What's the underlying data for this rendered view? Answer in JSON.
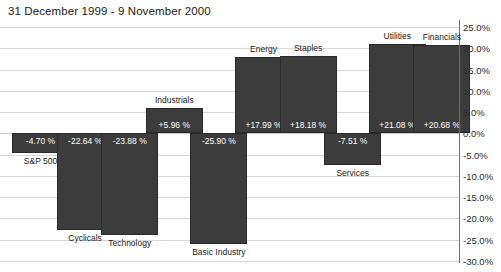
{
  "chart_data": {
    "type": "bar",
    "title": "31 December 1999 - 9 November 2000",
    "xlabel": "",
    "ylabel": "",
    "ylim": [
      -30.0,
      25.0
    ],
    "grid": true,
    "legend": "none",
    "categories": [
      "S&P 500",
      "Cyclicals",
      "Technology",
      "Industrials",
      "Basic Industry",
      "Energy",
      "Staples",
      "Services",
      "Utilities",
      "Financials"
    ],
    "values": [
      -4.7,
      -22.64,
      -23.88,
      5.96,
      -25.9,
      17.99,
      18.18,
      -7.51,
      21.08,
      20.68
    ],
    "value_labels": [
      "-4.70 %",
      "-22.64 %",
      "-23.88 %",
      "+5.96 %",
      "-25.90 %",
      "+17.99 %",
      "+18.18 %",
      "-7.51 %",
      "+21.08 %",
      "+20.68 %"
    ],
    "yticks": [
      "25.0%",
      "20.0%",
      "15.0%",
      "10.0%",
      "5.0%",
      "0.0%",
      "-5.0%",
      "-10.0%",
      "-15.0%",
      "-20.0%",
      "-25.0%",
      "-30.0%"
    ],
    "ytick_values": [
      25.0,
      20.0,
      15.0,
      10.0,
      5.0,
      0.0,
      -5.0,
      -10.0,
      -15.0,
      -20.0,
      -25.0,
      -30.0
    ],
    "colors": {
      "bar": "#3c3c3c",
      "bar_border": "#2a2a2a",
      "grid": "#d8d8d8",
      "axis": "#3d3d3d",
      "text": "#1b1b1b",
      "value_text": "#ffffff",
      "background": "#ffffff"
    }
  }
}
